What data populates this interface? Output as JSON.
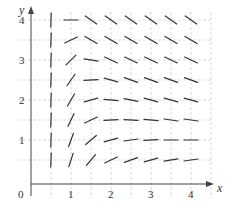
{
  "chart_data": {
    "type": "slope_field",
    "title": "",
    "xlabel": "x",
    "ylabel": "y",
    "xlim": [
      0,
      4.5
    ],
    "ylim": [
      0,
      4.2
    ],
    "origin_label": "0",
    "x_ticks": [
      {
        "value": 1,
        "label": "1"
      },
      {
        "value": 2,
        "label": "2"
      },
      {
        "value": 3,
        "label": "3"
      },
      {
        "value": 4,
        "label": "4"
      }
    ],
    "y_ticks": [
      {
        "value": 1,
        "label": "1"
      },
      {
        "value": 2,
        "label": "2"
      },
      {
        "value": 3,
        "label": "3"
      },
      {
        "value": 4,
        "label": "4"
      }
    ],
    "grid": {
      "on": true,
      "style": "dashed",
      "spacing": 0.5,
      "x_max": 4.5,
      "y_max": 4
    },
    "sample_x": [
      0.5,
      1,
      1.5,
      2,
      2.5,
      3,
      3.5,
      4
    ],
    "sample_y": [
      4,
      3.5,
      3,
      2.5,
      2,
      1.5,
      1,
      0.5
    ],
    "segment_angles_deg": [
      [
        88,
        0,
        -35,
        -35,
        -35,
        -35,
        -35,
        -35
      ],
      [
        88,
        25,
        -30,
        -30,
        -30,
        -30,
        -30,
        -30
      ],
      [
        88,
        45,
        -10,
        -25,
        -25,
        -25,
        -25,
        -25
      ],
      [
        88,
        55,
        3,
        -15,
        -20,
        -20,
        -20,
        -20
      ],
      [
        88,
        60,
        15,
        -5,
        -12,
        -15,
        -15,
        -15
      ],
      [
        88,
        65,
        25,
        3,
        -3,
        -5,
        -8,
        -8
      ],
      [
        88,
        70,
        40,
        15,
        8,
        3,
        0,
        0
      ],
      [
        88,
        72,
        50,
        25,
        20,
        15,
        10,
        8
      ]
    ]
  },
  "colors": {
    "segment": "#333333",
    "axis": "#444444",
    "grid": "#c8c8c8"
  }
}
